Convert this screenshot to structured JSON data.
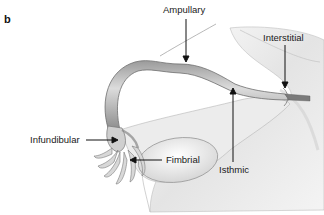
{
  "panel_label": "b",
  "labels": {
    "ampullary": "Ampullary",
    "interstitial": "Interstitial",
    "infundibular": "Infundibular",
    "fimbrial": "Fimbrial",
    "isthmic": "Isthmic"
  },
  "colors": {
    "text": "#1a1a1a",
    "tube_light": "#d8d8d8",
    "tube_dark": "#8a8a8a",
    "ovary": "#f2f2f2",
    "uterus_shade": "#cfcfcf"
  }
}
